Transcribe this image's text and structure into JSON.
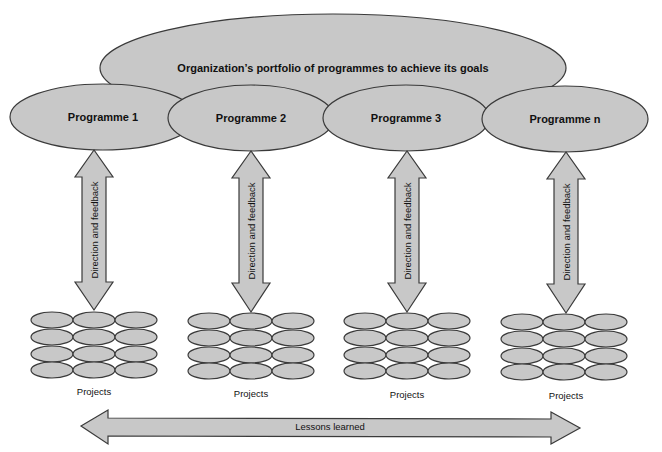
{
  "portfolio": {
    "label": "Organization’s portfolio of programmes to achieve its goals"
  },
  "programmes": [
    {
      "label": "Programme 1",
      "cx": 103,
      "cy": 117
    },
    {
      "label": "Programme 2",
      "cx": 251,
      "cy": 118
    },
    {
      "label": "Programme 3",
      "cx": 406,
      "cy": 118
    },
    {
      "label": "Programme n",
      "cx": 565,
      "cy": 119
    }
  ],
  "direction_arrow": {
    "label": "Direction and feedback"
  },
  "project_groups": [
    {
      "label": "Projects",
      "x": 31
    },
    {
      "label": "Projects",
      "x": 188
    },
    {
      "label": "Projects",
      "x": 344
    },
    {
      "label": "Projects",
      "x": 501
    }
  ],
  "lessons_arrow": {
    "label": "Lessons learned"
  },
  "colors": {
    "fill": "#c8c8c8",
    "stroke": "#3a3a3a"
  }
}
